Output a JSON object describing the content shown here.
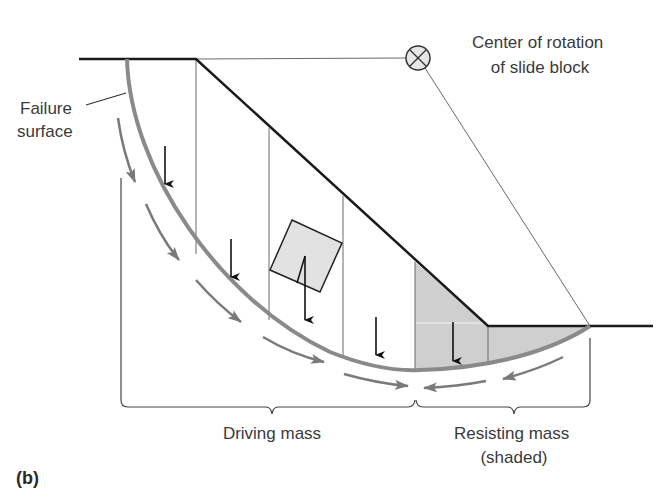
{
  "figure": {
    "panel_label": "(b)",
    "colors": {
      "ground": "#1a1a1a",
      "thin_line": "#6a6a6a",
      "failure_surface": "#8a8a8a",
      "shaded_fill": "#cfcfcf",
      "block_fill": "#e2e2e2",
      "arrow_gray": "#7a7a7a",
      "arrow_black": "#111111",
      "center_fill": "#e6e6e6"
    }
  },
  "labels": {
    "failure_surface_line1": "Failure",
    "failure_surface_line2": "surface",
    "center_line1": "Center of rotation",
    "center_line2": "of slide block",
    "driving_mass": "Driving mass",
    "resisting_mass_line1": "Resisting mass",
    "resisting_mass_line2": "(shaded)"
  },
  "elements": {
    "center_of_rotation_icon": "circle-with-x",
    "slice_count": 6,
    "black_weight_arrows": 6,
    "gray_movement_arrows_driving": 4,
    "gray_movement_arrows_resisting": 2
  }
}
